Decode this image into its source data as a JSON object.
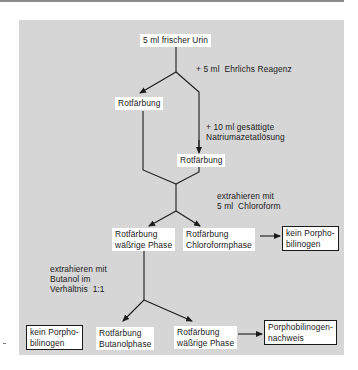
{
  "diagram": {
    "title": "",
    "start": {
      "label": "5 ml frischer Urin"
    },
    "steps": {
      "add_ehrlich": "+ 5 ml  Ehrlichs Reagenz",
      "add_natrium": "+ 10 ml gesättigte\nNatriumazetatlösung",
      "extract_chloroform": "extrahieren mit\n5 ml  Chloroform",
      "extract_butanol": "extrahieren mit\nButanol im\nVerhältnis  1:1"
    },
    "nodes": {
      "rotfaerbung_1": "Rotfärbung",
      "rotfaerbung_2": "Rotfärbung",
      "waessrige_phase_1": "Rotfärbung\nwäßrige Phase",
      "chloroformphase": "Rotfärbung\nChloroformphase",
      "kein_pbg_1": "kein Porpho-\nbilinogen",
      "kein_pbg_2": "kein Porpho-\nbilinogen",
      "butanolphase": "Rotfärbung\nButanolphase",
      "waessrige_phase_2": "Rotfärbung\nwäßrige Phase",
      "pbg_nachweis": "Porphobilinogen-\nnachweis"
    },
    "colors": {
      "panel": "#d6d6d6",
      "box": "#ffffff",
      "line": "#1a1a1a"
    }
  }
}
